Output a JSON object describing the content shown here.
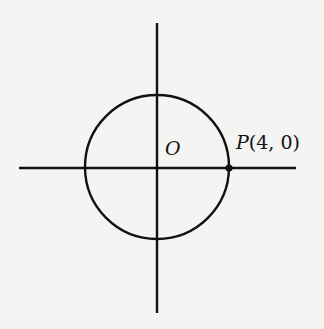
{
  "diagram": {
    "type": "coordinate-circle",
    "origin_label": "O",
    "point": {
      "name": "P",
      "coords": "(4, 0)",
      "x": 4,
      "y": 0
    },
    "circle": {
      "center": "O",
      "radius": 4
    },
    "colors": {
      "stroke": "#111111",
      "background": "#f4f4f2"
    }
  }
}
